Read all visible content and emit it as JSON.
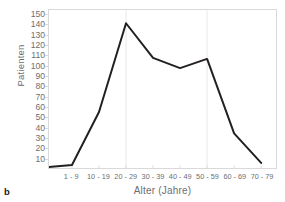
{
  "panel": {
    "letter": "b"
  },
  "chart_data": {
    "type": "line",
    "title": "",
    "subtitle": "",
    "xlabel": "Alter (Jahre)",
    "ylabel": "Patienten",
    "categories": [
      "1 - 9",
      "10 - 19",
      "20 - 29",
      "30 - 39",
      "40 - 49",
      "50 - 59",
      "60 - 69",
      "70 - 79"
    ],
    "values": [
      3,
      55,
      142,
      108,
      98,
      107,
      34,
      5
    ],
    "series": [
      {
        "name": "Patienten",
        "values": [
          3,
          55,
          142,
          108,
          98,
          107,
          34,
          5
        ]
      }
    ],
    "ylim": [
      0,
      155
    ],
    "yticks": [
      10,
      20,
      30,
      40,
      50,
      60,
      70,
      80,
      90,
      100,
      110,
      120,
      130,
      140,
      150
    ],
    "ytick_labels": [
      "10",
      "20",
      "30",
      "40",
      "50",
      "60",
      "70",
      "80",
      "90",
      "100",
      "110",
      "120",
      "130",
      "140",
      "150"
    ],
    "xtick_labels": [
      "1 - 9",
      "10 - 19",
      "20 - 29",
      "30 - 39",
      "40 - 49",
      "50 - 59",
      "60 - 69",
      "70 - 79"
    ],
    "grid": "vertical-faint",
    "gridlines_x": [
      "20 - 29",
      "50 - 59"
    ],
    "legend": "none",
    "legend_position": "none",
    "line_color": "#231f20",
    "line_width": 2,
    "axis_color": "#d9d9d9",
    "text_color": "#6d6e71",
    "background": "#ffffff",
    "leading_point": {
      "note": "line begins at left frame edge near baseline",
      "value": 1
    }
  }
}
